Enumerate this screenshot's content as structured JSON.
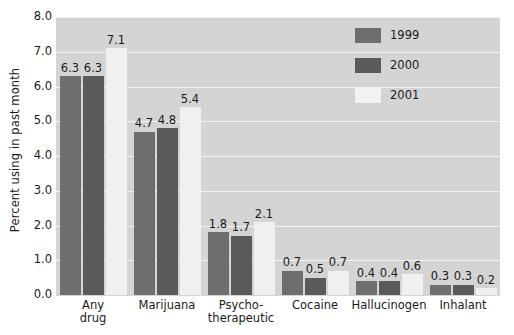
{
  "chart_data": {
    "type": "bar",
    "title": "",
    "xlabel": "",
    "ylabel": "Percent using in past month",
    "ylim": [
      0.0,
      8.0
    ],
    "ytick_step": 1.0,
    "ytick_labels": [
      "0.0",
      "1.0",
      "2.0",
      "3.0",
      "4.0",
      "5.0",
      "6.0",
      "7.0",
      "8.0"
    ],
    "grid": true,
    "legend_position": "upper right",
    "categories": [
      {
        "lines": [
          "Any",
          "drug"
        ]
      },
      {
        "lines": [
          "Marijuana"
        ]
      },
      {
        "lines": [
          "Psycho-",
          "therapeutic"
        ]
      },
      {
        "lines": [
          "Cocaine"
        ]
      },
      {
        "lines": [
          "Hallucinogen"
        ]
      },
      {
        "lines": [
          "Inhalant"
        ]
      }
    ],
    "series": [
      {
        "name": "1999",
        "color": "#6e6e6e",
        "values": [
          6.3,
          4.7,
          1.8,
          0.7,
          0.4,
          0.3
        ],
        "labels": [
          "6.3",
          "4.7",
          "1.8",
          "0.7",
          "0.4",
          "0.3"
        ]
      },
      {
        "name": "2000",
        "color": "#5a5a5a",
        "values": [
          6.3,
          4.8,
          1.7,
          0.5,
          0.4,
          0.3
        ],
        "labels": [
          "6.3",
          "4.8",
          "1.7",
          "0.5",
          "0.4",
          "0.3"
        ]
      },
      {
        "name": "2001",
        "color": "#f0f0f0",
        "values": [
          7.1,
          5.4,
          2.1,
          0.7,
          0.6,
          0.2
        ],
        "labels": [
          "7.1",
          "5.4",
          "2.1",
          "0.7",
          "0.6",
          "0.2"
        ]
      }
    ],
    "plot_background": "#d4d4d4",
    "gridline_color": "#f2f2f2"
  },
  "legend": {
    "entries": [
      {
        "label": "1999",
        "swatch_class": "y1999"
      },
      {
        "label": "2000",
        "swatch_class": "y2000"
      },
      {
        "label": "2001",
        "swatch_class": "y2001"
      }
    ]
  }
}
